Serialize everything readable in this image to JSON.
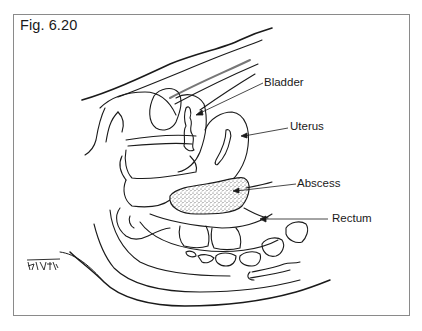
{
  "figure": {
    "title": "Fig. 6.20",
    "signature": "Bhatia"
  },
  "labels": {
    "bladder": "Bladder",
    "uterus": "Uterus",
    "abscess": "Abscess",
    "rectum": "Rectum"
  },
  "colors": {
    "line": "#1a1a1a",
    "frame": "#8a8a8a",
    "stipple": "#555555",
    "background": "#ffffff"
  }
}
